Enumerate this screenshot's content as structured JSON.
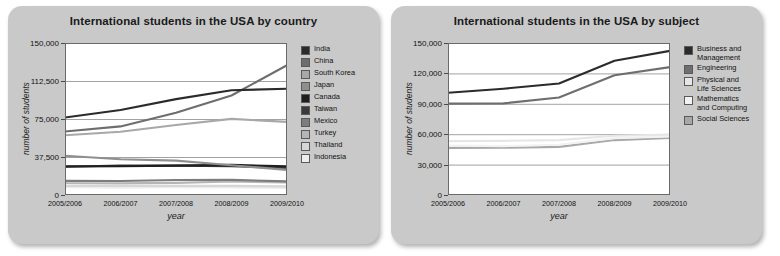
{
  "panels": [
    {
      "title": "International students in the USA by country",
      "xlabel": "year",
      "ylabel": "number of students"
    },
    {
      "title": "International students in the USA by subject",
      "xlabel": "year",
      "ylabel": "number of students"
    }
  ],
  "chart_data": [
    {
      "type": "line",
      "title": "International students in the USA by country",
      "xlabel": "year",
      "ylabel": "number of students",
      "x": [
        "2005/2006",
        "2006/2007",
        "2007/2008",
        "2008/2009",
        "2009/2010"
      ],
      "ylim": [
        0,
        150000
      ],
      "yticks": [
        0,
        37500,
        75000,
        112500,
        150000
      ],
      "ytick_labels": [
        "0",
        "37,500",
        "75,000",
        "112,500",
        "150,000"
      ],
      "grid": true,
      "legend_position": "right",
      "series": [
        {
          "name": "India",
          "color": "#2b2b2b",
          "values": [
            76500,
            83800,
            94600,
            103300,
            104900
          ]
        },
        {
          "name": "China",
          "color": "#6e6e6e",
          "values": [
            62600,
            67700,
            81100,
            98200,
            128000
          ]
        },
        {
          "name": "South Korea",
          "color": "#a8a8a8",
          "values": [
            59000,
            62400,
            69100,
            75100,
            72200
          ]
        },
        {
          "name": "Japan",
          "color": "#8f8f8f",
          "values": [
            38700,
            35300,
            33900,
            29300,
            24800
          ]
        },
        {
          "name": "Canada",
          "color": "#1f1f1f",
          "values": [
            28200,
            28300,
            29000,
            29700,
            28200
          ]
        },
        {
          "name": "Taiwan",
          "color": "#3a3a3a",
          "values": [
            27900,
            29100,
            29000,
            28500,
            26700
          ]
        },
        {
          "name": "Mexico",
          "color": "#7d7d7d",
          "values": [
            13900,
            13800,
            14800,
            14900,
            13400
          ]
        },
        {
          "name": "Turkey",
          "color": "#b5b5b5",
          "values": [
            11600,
            11500,
            12000,
            13300,
            12400
          ]
        },
        {
          "name": "Thailand",
          "color": "#d6d6d6",
          "values": [
            8900,
            8900,
            9000,
            9000,
            8500
          ]
        },
        {
          "name": "Indonesia",
          "color": "#ededed",
          "values": [
            7600,
            7300,
            7700,
            7500,
            6900
          ]
        }
      ]
    },
    {
      "type": "line",
      "title": "International students in the USA by subject",
      "xlabel": "year",
      "ylabel": "number of students",
      "x": [
        "2005/2006",
        "2006/2007",
        "2007/2008",
        "2008/2009",
        "2009/2010"
      ],
      "ylim": [
        0,
        150000
      ],
      "yticks": [
        0,
        30000,
        60000,
        90000,
        120000,
        150000
      ],
      "ytick_labels": [
        "0",
        "30,000",
        "60,000",
        "90,000",
        "120,000",
        "150,000"
      ],
      "grid": true,
      "legend_position": "right",
      "series": [
        {
          "name": "Business and\nManagement",
          "color": "#2b2b2b",
          "values": [
            100900,
            104900,
            110100,
            132400,
            142200
          ]
        },
        {
          "name": "Engineering",
          "color": "#6e6e6e",
          "values": [
            90200,
            90400,
            96300,
            118100,
            126200
          ]
        },
        {
          "name": "Physical and\nLife Sciences",
          "color": "#e6e6e6",
          "values": [
            53200,
            53400,
            54200,
            58400,
            59700
          ]
        },
        {
          "name": "Mathematics\nand Computing",
          "color": "#f2f2f2",
          "values": [
            48800,
            48200,
            49600,
            56100,
            57800
          ]
        },
        {
          "name": "Social Sciences",
          "color": "#a8a8a8",
          "values": [
            46500,
            46600,
            47500,
            54200,
            56300
          ]
        }
      ]
    }
  ]
}
